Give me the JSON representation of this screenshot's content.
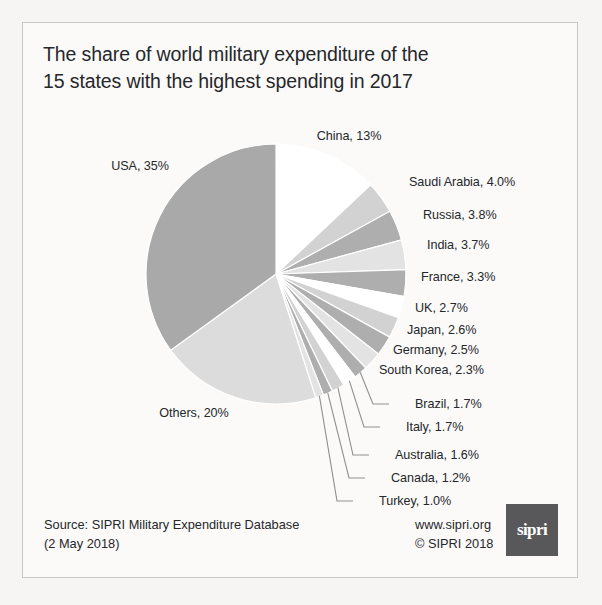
{
  "figure": {
    "title_line1": "The share of world military expenditure of the",
    "title_line2": "15 states with the highest spending in 2017",
    "background_color": "#fbfaf9",
    "border_color": "#c9c8c6"
  },
  "footer": {
    "source_line1": "Source: SIPRI Military Expenditure Database",
    "source_line2": "(2 May 2018)",
    "website": "www.sipri.org",
    "copyright": "© SIPRI 2018",
    "logo_text": "sipri",
    "logo_color": "#58585a"
  },
  "chart_data": {
    "type": "pie",
    "title": "The share of world military expenditure of the 15 states with the highest spending in 2017",
    "unit": "percent of world military expenditure",
    "year": 2017,
    "start_angle_deg": 0,
    "direction": "clockwise",
    "legend": "none (direct labels)",
    "categories": [
      "China",
      "Saudi Arabia",
      "Russia",
      "India",
      "France",
      "UK",
      "Japan",
      "Germany",
      "South Korea",
      "Brazil",
      "Italy",
      "Australia",
      "Canada",
      "Turkey",
      "Others",
      "USA"
    ],
    "values": [
      13,
      4.0,
      3.8,
      3.7,
      3.3,
      2.7,
      2.6,
      2.5,
      2.3,
      1.7,
      1.7,
      1.6,
      1.2,
      1.0,
      20,
      35
    ],
    "slices": [
      {
        "name": "China",
        "label": "China, 13%",
        "value": 13,
        "color": "#ffffff",
        "label_style": "direct"
      },
      {
        "name": "Saudi Arabia",
        "label": "Saudi Arabia, 4.0%",
        "value": 4.0,
        "color": "#d2d2d2",
        "label_style": "direct"
      },
      {
        "name": "Russia",
        "label": "Russia, 3.8%",
        "value": 3.8,
        "color": "#aeaeae",
        "label_style": "direct"
      },
      {
        "name": "India",
        "label": "India, 3.7%",
        "value": 3.7,
        "color": "#e3e3e3",
        "label_style": "direct"
      },
      {
        "name": "France",
        "label": "France, 3.3%",
        "value": 3.3,
        "color": "#aeaeae",
        "label_style": "direct"
      },
      {
        "name": "UK",
        "label": "UK, 2.7%",
        "value": 2.7,
        "color": "#ffffff",
        "label_style": "direct"
      },
      {
        "name": "Japan",
        "label": "Japan, 2.6%",
        "value": 2.6,
        "color": "#d2d2d2",
        "label_style": "direct"
      },
      {
        "name": "Germany",
        "label": "Germany, 2.5%",
        "value": 2.5,
        "color": "#aeaeae",
        "label_style": "direct"
      },
      {
        "name": "South Korea",
        "label": "South Korea, 2.3%",
        "value": 2.3,
        "color": "#e3e3e3",
        "label_style": "direct"
      },
      {
        "name": "Brazil",
        "label": "Brazil, 1.7%",
        "value": 1.7,
        "color": "#aeaeae",
        "label_style": "leader-line"
      },
      {
        "name": "Italy",
        "label": "Italy, 1.7%",
        "value": 1.7,
        "color": "#ffffff",
        "label_style": "leader-line"
      },
      {
        "name": "Australia",
        "label": "Australia, 1.6%",
        "value": 1.6,
        "color": "#d2d2d2",
        "label_style": "leader-line"
      },
      {
        "name": "Canada",
        "label": "Canada, 1.2%",
        "value": 1.2,
        "color": "#aeaeae",
        "label_style": "leader-line"
      },
      {
        "name": "Turkey",
        "label": "Turkey, 1.0%",
        "value": 1.0,
        "color": "#e3e3e3",
        "label_style": "leader-line"
      },
      {
        "name": "Others",
        "label": "Others, 20%",
        "value": 20,
        "color": "#dcdcdc",
        "label_style": "direct"
      },
      {
        "name": "USA",
        "label": "USA, 35%",
        "value": 35,
        "color": "#a9a9a9",
        "label_style": "direct"
      }
    ]
  }
}
